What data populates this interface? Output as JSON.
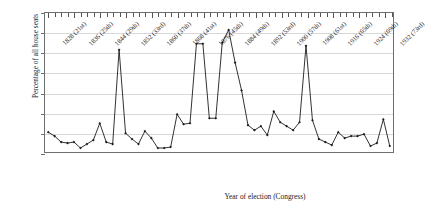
{
  "chart_data": {
    "type": "line",
    "title": "",
    "xlabel": "Year of election (Congress)",
    "ylabel": "Percentage of all house seats",
    "ylim": [
      0,
      14
    ],
    "ytick_labels": [
      "0.0%",
      "2.0%",
      "4.0%",
      "6.0%",
      "8.0%",
      "10.0%",
      "12.0%",
      "14.0%"
    ],
    "ytick_values": [
      0,
      2,
      4,
      6,
      8,
      10,
      12,
      14
    ],
    "grid": true,
    "legend": "none",
    "marker": "diamond",
    "line_color": "#1a1a1a",
    "x_labeled_ticks": [
      "1828 (21st)",
      "1836 (25th)",
      "1844 (29th)",
      "1852 (33rd)",
      "1860 (37th)",
      "1868 (41st)",
      "1876 (45th)",
      "1884 (49th)",
      "1892 (53rd)",
      "1900 (57th)",
      "1908 (61st)",
      "1916 (65th)",
      "1924 (69th)",
      "1932 (73rd)"
    ],
    "x_label_interval": 4,
    "x": [
      1828,
      1830,
      1832,
      1834,
      1836,
      1838,
      1840,
      1842,
      1844,
      1846,
      1848,
      1850,
      1852,
      1854,
      1856,
      1858,
      1860,
      1862,
      1864,
      1866,
      1868,
      1870,
      1872,
      1874,
      1876,
      1878,
      1880,
      1882,
      1884,
      1886,
      1888,
      1890,
      1892,
      1894,
      1896,
      1898,
      1900,
      1902,
      1904,
      1906,
      1908,
      1910,
      1912,
      1914,
      1916,
      1918,
      1920,
      1922,
      1924,
      1926,
      1928,
      1930,
      1932,
      1934
    ],
    "values": [
      2.0,
      1.6,
      1.0,
      0.9,
      1.0,
      0.4,
      0.8,
      1.2,
      2.9,
      1.0,
      0.8,
      10.3,
      1.9,
      1.3,
      0.8,
      2.1,
      1.4,
      0.4,
      0.4,
      0.5,
      3.8,
      2.8,
      2.9,
      10.9,
      10.9,
      3.4,
      3.4,
      11.0,
      12.3,
      9.0,
      6.2,
      2.7,
      2.2,
      2.6,
      1.7,
      4.1,
      3.0,
      2.6,
      2.2,
      3.0,
      10.7,
      3.2,
      1.3,
      1.0,
      0.7,
      2.0,
      1.4,
      1.6,
      1.6,
      1.8,
      0.6,
      0.9,
      3.3,
      0.6
    ]
  }
}
